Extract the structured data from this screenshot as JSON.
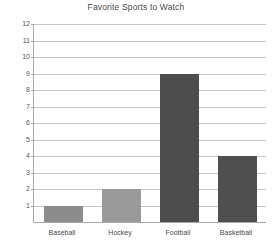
{
  "chart_data": {
    "type": "bar",
    "title": "Favorite Sports to Watch",
    "xlabel": "",
    "ylabel": "",
    "categories": [
      "Baseball",
      "Hockey",
      "Football",
      "Basketball"
    ],
    "values": [
      1,
      2,
      9,
      4
    ],
    "bar_colors": [
      "#8c8c8c",
      "#9a9a9a",
      "#4d4d4d",
      "#4f4f4f"
    ],
    "ylim": [
      0,
      12
    ],
    "ytick_labels": [
      "1",
      "2",
      "3",
      "4",
      "5",
      "6",
      "7",
      "8",
      "9",
      "10",
      "11",
      "12"
    ],
    "ytick_values": [
      1,
      2,
      3,
      4,
      5,
      6,
      7,
      8,
      9,
      10,
      11,
      12
    ],
    "grid": true,
    "legend": false,
    "grid_color": "#c6c6c6",
    "axis_color": "#a8a8a8",
    "title_color": "#4a4a4a",
    "background": "#ffffff"
  }
}
